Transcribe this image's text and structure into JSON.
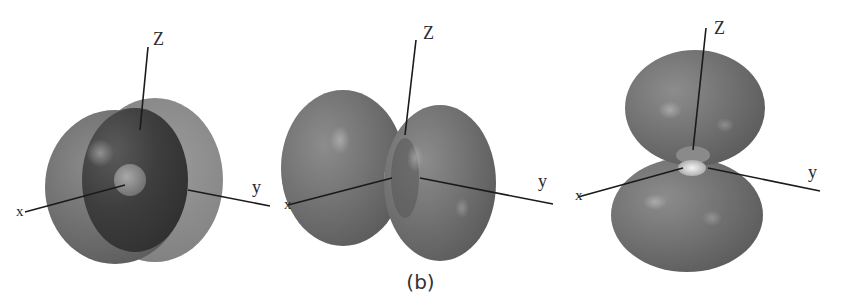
{
  "figure": {
    "caption": "(b)",
    "panels": [
      {
        "id": "panel-1",
        "description": "spherical orbital with radial node (cutaway)",
        "axes": {
          "z_label": "Z",
          "x_label": "x",
          "y_label": "y"
        }
      },
      {
        "id": "panel-2",
        "description": "two-lobed orbital along x-axis",
        "axes": {
          "z_label": "Z",
          "x_label": "x",
          "y_label": "y"
        }
      },
      {
        "id": "panel-3",
        "description": "two-lobed orbital along z-axis",
        "axes": {
          "z_label": "Z",
          "x_label": "x",
          "y_label": "y"
        }
      }
    ],
    "colors": {
      "lobe_fill": "#6f6f6f",
      "lobe_dark": "#3f3f3f",
      "lobe_light": "#8a8a8a",
      "axis_line": "#1a1a1a",
      "background": "#ffffff"
    }
  }
}
